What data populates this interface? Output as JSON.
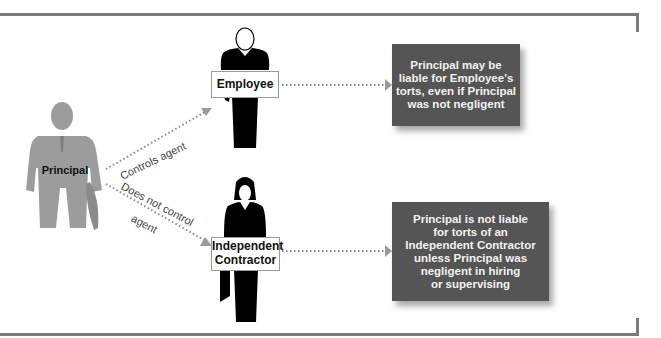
{
  "diagram": {
    "nodes": {
      "principal": {
        "label": "Principal",
        "icon": "gray-businessman-icon"
      },
      "employee": {
        "label": "Employee",
        "icon": "black-employee-figure-icon"
      },
      "independent_contractor": {
        "label_line1": "Independent",
        "label_line2": "Contractor",
        "icon": "black-woman-figure-icon"
      }
    },
    "edges": {
      "controls": {
        "label": "Controls agent"
      },
      "does_not_control": {
        "label_line1": "Does not control",
        "label_line2": "agent"
      }
    },
    "results": {
      "employee_result": "Principal may be\nliable for Employee's\ntorts, even if Principal\nwas not negligent",
      "contractor_result": "Principal is not liable\nfor torts of an\nIndependent Contractor\nunless Principal was\nnegligent in hiring\nor supervising"
    },
    "colors": {
      "frame": "#7a7a7a",
      "principal_figure": "#999999",
      "agent_figure": "#000000",
      "result_box": "#555555",
      "arrow": "#999999"
    }
  }
}
